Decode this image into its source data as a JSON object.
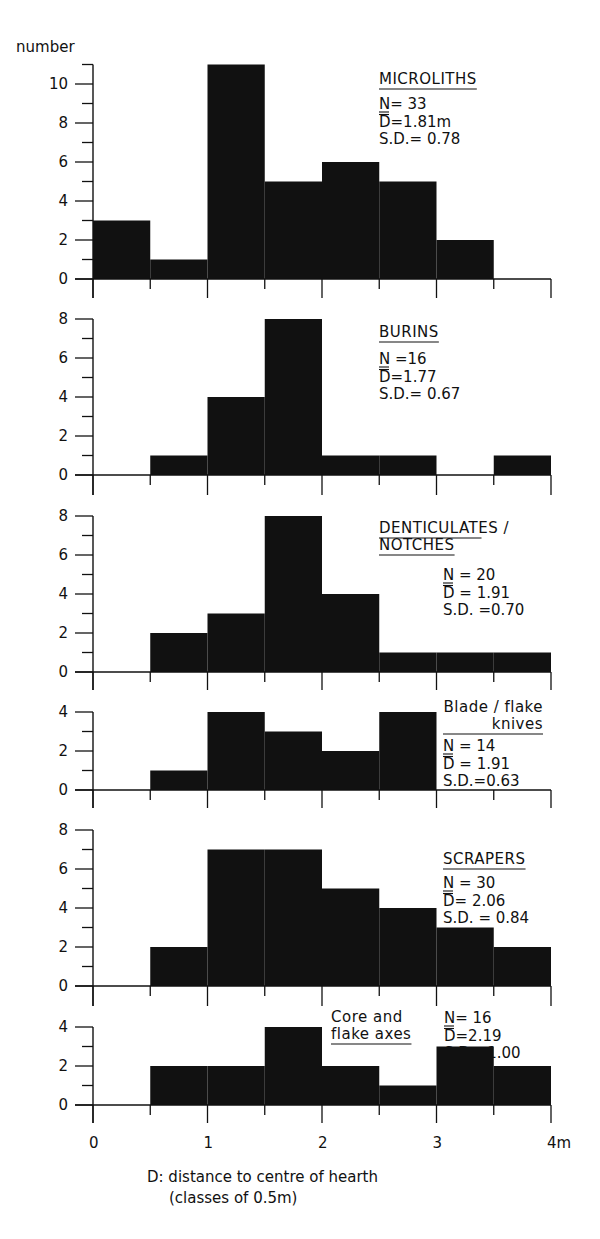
{
  "figure": {
    "y_axis_label": "number",
    "x_unit_suffix": "m",
    "caption_line1": "D: distance to centre of hearth",
    "caption_line2": "(classes of 0.5m)"
  },
  "colors": {
    "ink": "#111111",
    "background": "#ffffff"
  },
  "chart_data": {
    "type": "bar",
    "subtype": "histogram-stack",
    "xlabel": "D: distance to centre of hearth (classes of 0.5m)",
    "ylabel": "number",
    "x_ticks": [
      "0",
      "1",
      "2",
      "3",
      "4m"
    ],
    "bin_edges": [
      0,
      0.5,
      1.0,
      1.5,
      2.0,
      2.5,
      3.0,
      3.5,
      4.0
    ],
    "categories": [
      "0-0.5",
      "0.5-1.0",
      "1.0-1.5",
      "1.5-2.0",
      "2.0-2.5",
      "2.5-3.0",
      "3.0-3.5",
      "3.5-4.0"
    ],
    "xlim": [
      0,
      4
    ],
    "grid": false,
    "series": [
      {
        "name": "MICROLITHS",
        "title_lines": [
          "MICROLITHS"
        ],
        "values": [
          3,
          1,
          11,
          5,
          6,
          5,
          2,
          0
        ],
        "N": "N= 33",
        "D": "D=1.81m",
        "SD": "S.D.= 0.78",
        "ylim": [
          0,
          11
        ],
        "y_ticks": [
          0,
          2,
          4,
          6,
          8,
          10
        ]
      },
      {
        "name": "BURINS",
        "title_lines": [
          "BURINS"
        ],
        "values": [
          0,
          1,
          4,
          8,
          1,
          1,
          0,
          1
        ],
        "N": "N =16",
        "D": "D=1.77",
        "SD": "S.D.= 0.67",
        "ylim": [
          0,
          8
        ],
        "y_ticks": [
          0,
          2,
          4,
          6,
          8
        ]
      },
      {
        "name": "DENTICULATES / NOTCHES",
        "title_lines": [
          "DENTICULATES /",
          "NOTCHES"
        ],
        "values": [
          0,
          2,
          3,
          8,
          4,
          1,
          1,
          1
        ],
        "N": "N = 20",
        "D": "D = 1.91",
        "SD": "S.D. =0.70",
        "ylim": [
          0,
          8
        ],
        "y_ticks": [
          0,
          2,
          4,
          6,
          8
        ]
      },
      {
        "name": "Blade/flake knives",
        "title_lines": [
          "Blade / flake",
          "knives"
        ],
        "values": [
          0,
          1,
          4,
          3,
          2,
          4,
          0,
          0
        ],
        "N": "N = 14",
        "D": "D = 1.91",
        "SD": "S.D.=0.63",
        "ylim": [
          0,
          4
        ],
        "y_ticks": [
          0,
          2,
          4
        ]
      },
      {
        "name": "SCRAPERS",
        "title_lines": [
          "SCRAPERS"
        ],
        "values": [
          0,
          2,
          7,
          7,
          5,
          4,
          3,
          2
        ],
        "N": "N = 30",
        "D": "D= 2.06",
        "SD": "S.D. = 0.84",
        "ylim": [
          0,
          8
        ],
        "y_ticks": [
          0,
          2,
          4,
          6,
          8
        ]
      },
      {
        "name": "Core and flake axes",
        "title_lines": [
          "Core and",
          "flake axes"
        ],
        "values": [
          0,
          2,
          2,
          4,
          2,
          1,
          3,
          2
        ],
        "N": "N= 16",
        "D": "D=2.19",
        "SD": "S.D =1.00",
        "ylim": [
          0,
          4
        ],
        "y_ticks": [
          0,
          2,
          4
        ]
      }
    ]
  }
}
